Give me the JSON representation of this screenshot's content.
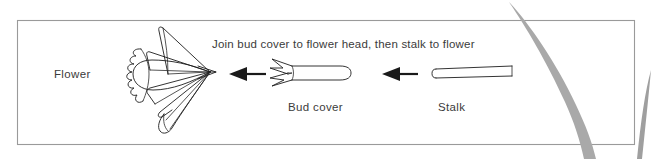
{
  "figure": {
    "type": "assembly-instruction-diagram",
    "instruction": "Join bud cover to flower head, then stalk to flower",
    "parts": [
      {
        "id": "flower",
        "label": "Flower"
      },
      {
        "id": "bud-cover",
        "label": "Bud cover"
      },
      {
        "id": "stalk",
        "label": "Stalk"
      }
    ],
    "arrows": [
      {
        "id": "arrow-budcover-to-flower",
        "direction": "left"
      },
      {
        "id": "arrow-stalk-to-budcover",
        "direction": "left"
      }
    ],
    "colors": {
      "ink": "#1d1d1d",
      "text": "#3b3b3b",
      "frame": "#9a9a9a",
      "grass": "#a8a8a8",
      "background": "#ffffff"
    }
  }
}
